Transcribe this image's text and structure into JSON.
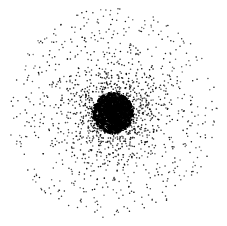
{
  "figure": {
    "type": "radial-scatter-network",
    "width": 227,
    "height": 226,
    "background": "#ffffff",
    "dot_color": "#000000",
    "center": [
      113,
      113
    ],
    "core": {
      "radius": 20,
      "count": 900,
      "dot_size": 1.3
    },
    "middle": {
      "radius": 55,
      "count": 900,
      "dot_size": 0.8
    },
    "outer": {
      "radius": 105,
      "count": 700,
      "dot_size": 0.75
    },
    "seed": 12345
  }
}
